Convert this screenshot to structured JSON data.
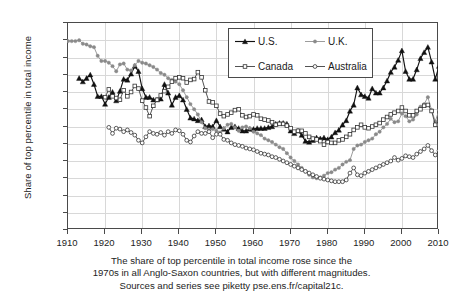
{
  "chart_data": {
    "type": "line",
    "title": "",
    "xlabel": "",
    "ylabel": "Share of top percentile in total income",
    "xlim": [
      1910,
      2010
    ],
    "ylim": [
      0,
      24
    ],
    "grid": true,
    "legend_position": "top-center",
    "ytick_labels": [
      "0%",
      "2%",
      "4%",
      "6%",
      "8%",
      "10%",
      "12%",
      "14%",
      "16%",
      "18%",
      "20%",
      "22%",
      "24%"
    ],
    "ytick_values": [
      0,
      2,
      4,
      6,
      8,
      10,
      12,
      14,
      16,
      18,
      20,
      22,
      24
    ],
    "xtick_labels": [
      "1910",
      "1920",
      "1930",
      "1940",
      "1950",
      "1960",
      "1970",
      "1980",
      "1990",
      "2000",
      "2010"
    ],
    "xtick_values": [
      1910,
      1920,
      1930,
      1940,
      1950,
      1960,
      1970,
      1980,
      1990,
      2000,
      2010
    ],
    "series": [
      {
        "name": "U.S.",
        "marker": "filled-triangle",
        "color": "#111111",
        "x": [
          1913,
          1914,
          1915,
          1916,
          1917,
          1918,
          1919,
          1920,
          1921,
          1922,
          1923,
          1924,
          1925,
          1926,
          1927,
          1928,
          1929,
          1930,
          1931,
          1932,
          1933,
          1934,
          1935,
          1936,
          1937,
          1938,
          1939,
          1940,
          1941,
          1942,
          1943,
          1944,
          1945,
          1946,
          1947,
          1948,
          1949,
          1950,
          1951,
          1952,
          1953,
          1954,
          1955,
          1956,
          1957,
          1958,
          1959,
          1960,
          1961,
          1962,
          1963,
          1964,
          1965,
          1966,
          1967,
          1968,
          1969,
          1970,
          1971,
          1972,
          1973,
          1974,
          1975,
          1976,
          1977,
          1978,
          1979,
          1980,
          1981,
          1982,
          1983,
          1984,
          1985,
          1986,
          1987,
          1988,
          1989,
          1990,
          1991,
          1992,
          1993,
          1994,
          1995,
          1996,
          1997,
          1998,
          1999,
          2000,
          2001,
          2002,
          2003,
          2004,
          2005,
          2006,
          2007,
          2008,
          2009,
          2010
        ],
        "y": [
          17.6,
          17.2,
          17.6,
          18.0,
          16.9,
          15.5,
          15.5,
          14.6,
          15.4,
          16.0,
          15.0,
          16.1,
          17.5,
          17.4,
          18.1,
          19.0,
          18.4,
          16.4,
          15.4,
          15.4,
          15.1,
          15.1,
          15.2,
          16.9,
          15.9,
          14.5,
          15.4,
          15.6,
          15.1,
          14.0,
          13.0,
          12.9,
          12.7,
          12.8,
          12.0,
          12.1,
          12.0,
          12.7,
          12.0,
          11.7,
          11.4,
          11.9,
          12.0,
          11.8,
          11.5,
          11.5,
          11.7,
          11.7,
          11.8,
          11.8,
          11.8,
          11.9,
          12.0,
          12.3,
          12.4,
          12.4,
          12.3,
          11.5,
          11.2,
          11.5,
          11.0,
          10.3,
          10.2,
          10.4,
          10.7,
          10.6,
          10.7,
          10.5,
          10.8,
          11.3,
          11.6,
          12.2,
          12.7,
          13.8,
          14.5,
          16.5,
          15.7,
          15.5,
          15.3,
          16.4,
          15.9,
          15.9,
          16.5,
          17.3,
          18.3,
          18.9,
          19.7,
          20.8,
          18.4,
          17.5,
          17.5,
          18.6,
          19.9,
          20.6,
          21.2,
          19.5,
          17.5,
          19.0
        ]
      },
      {
        "name": "U.K.",
        "marker": "filled-circle",
        "color": "#8a8a8a",
        "x": [
          1910,
          1911,
          1912,
          1913,
          1914,
          1915,
          1916,
          1917,
          1918,
          1919,
          1920,
          1921,
          1922,
          1923,
          1924,
          1925,
          1926,
          1927,
          1928,
          1929,
          1930,
          1931,
          1932,
          1933,
          1934,
          1935,
          1936,
          1937,
          1938,
          1939,
          1940,
          1941,
          1942,
          1943,
          1944,
          1945,
          1946,
          1947,
          1948,
          1949,
          1950,
          1951,
          1952,
          1953,
          1954,
          1955,
          1956,
          1957,
          1958,
          1959,
          1960,
          1961,
          1962,
          1963,
          1964,
          1965,
          1966,
          1967,
          1968,
          1969,
          1970,
          1971,
          1972,
          1973,
          1974,
          1975,
          1976,
          1977,
          1978,
          1979,
          1980,
          1981,
          1982,
          1983,
          1984,
          1985,
          1986,
          1987,
          1988,
          1989,
          1990,
          1991,
          1992,
          1993,
          1994,
          1995,
          1996,
          1997,
          1998,
          1999,
          2000,
          2001,
          2002,
          2003,
          2004,
          2005,
          2006,
          2007,
          2008,
          2009,
          2010
        ],
        "y": [
          21.9,
          21.9,
          21.9,
          22.0,
          21.6,
          21.5,
          21.3,
          21.2,
          20.2,
          19.6,
          19.6,
          19.4,
          19.0,
          18.4,
          19.2,
          19.3,
          18.6,
          18.5,
          19.1,
          19.6,
          19.4,
          19.3,
          19.1,
          18.9,
          18.6,
          18.2,
          18.0,
          17.6,
          17.4,
          17.2,
          16.9,
          16.2,
          15.4,
          14.6,
          14.0,
          13.4,
          12.5,
          11.8,
          11.6,
          11.7,
          11.5,
          11.3,
          11.8,
          12.2,
          12.3,
          11.9,
          11.5,
          11.9,
          12.0,
          11.8,
          11.4,
          11.2,
          11.0,
          10.6,
          10.4,
          10.2,
          9.9,
          9.6,
          9.4,
          8.9,
          8.4,
          8.0,
          7.6,
          7.2,
          6.8,
          6.4,
          6.1,
          6.0,
          6.1,
          6.3,
          6.6,
          6.7,
          7.0,
          7.2,
          7.6,
          7.9,
          8.1,
          9.4,
          9.8,
          9.9,
          10.2,
          10.4,
          10.6,
          11.1,
          11.4,
          11.9,
          12.3,
          12.9,
          12.5,
          12.6,
          13.5,
          13.2,
          12.6,
          12.8,
          13.4,
          14.3,
          14.6,
          15.4,
          13.9,
          12.6,
          13.9
        ]
      },
      {
        "name": "Canada",
        "marker": "open-square",
        "color": "#333333",
        "x": [
          1920,
          1921,
          1922,
          1923,
          1924,
          1925,
          1926,
          1927,
          1928,
          1929,
          1930,
          1931,
          1932,
          1933,
          1934,
          1935,
          1936,
          1937,
          1938,
          1939,
          1940,
          1941,
          1942,
          1943,
          1944,
          1945,
          1946,
          1947,
          1948,
          1949,
          1950,
          1951,
          1952,
          1953,
          1954,
          1955,
          1956,
          1957,
          1958,
          1959,
          1960,
          1961,
          1962,
          1963,
          1964,
          1965,
          1966,
          1967,
          1968,
          1969,
          1970,
          1971,
          1972,
          1973,
          1974,
          1975,
          1976,
          1977,
          1978,
          1979,
          1980,
          1981,
          1982,
          1983,
          1984,
          1985,
          1986,
          1987,
          1988,
          1989,
          1990,
          1991,
          1992,
          1993,
          1994,
          1995,
          1996,
          1997,
          1998,
          1999,
          2000,
          2001,
          2002,
          2003,
          2004,
          2005,
          2006,
          2007,
          2008,
          2009,
          2010
        ],
        "y": [
          15.4,
          16.3,
          15.5,
          15.3,
          15.1,
          16.2,
          15.5,
          16.0,
          16.7,
          16.4,
          15.0,
          14.2,
          13.2,
          14.4,
          15.1,
          15.6,
          16.1,
          16.6,
          17.2,
          17.6,
          17.7,
          17.6,
          17.1,
          17.4,
          17.5,
          18.3,
          17.7,
          16.2,
          14.9,
          14.8,
          14.4,
          13.5,
          13.2,
          13.4,
          13.6,
          13.9,
          14.0,
          13.3,
          13.1,
          13.2,
          13.4,
          13.3,
          12.9,
          12.8,
          12.7,
          12.5,
          12.2,
          12.3,
          12.3,
          12.1,
          11.8,
          11.4,
          11.5,
          11.5,
          11.2,
          10.8,
          10.6,
          10.5,
          10.3,
          9.9,
          10.2,
          10.1,
          10.1,
          10.4,
          10.5,
          10.8,
          11.1,
          11.6,
          11.9,
          12.2,
          11.9,
          11.8,
          12.0,
          12.2,
          12.4,
          12.8,
          13.1,
          13.4,
          13.6,
          13.8,
          14.2,
          13.8,
          13.3,
          13.3,
          13.8,
          14.0,
          14.4,
          14.5,
          13.8,
          12.2,
          12.2
        ]
      },
      {
        "name": "Australia",
        "marker": "open-circle",
        "color": "#333333",
        "x": [
          1921,
          1922,
          1923,
          1924,
          1925,
          1926,
          1927,
          1928,
          1929,
          1930,
          1931,
          1932,
          1933,
          1934,
          1935,
          1936,
          1937,
          1938,
          1939,
          1940,
          1941,
          1942,
          1943,
          1944,
          1945,
          1946,
          1947,
          1948,
          1949,
          1950,
          1951,
          1952,
          1953,
          1954,
          1955,
          1956,
          1957,
          1958,
          1959,
          1960,
          1961,
          1962,
          1963,
          1964,
          1965,
          1966,
          1967,
          1968,
          1969,
          1970,
          1971,
          1972,
          1973,
          1974,
          1975,
          1976,
          1977,
          1978,
          1979,
          1980,
          1981,
          1982,
          1983,
          1984,
          1985,
          1986,
          1987,
          1988,
          1989,
          1990,
          1991,
          1992,
          1993,
          1994,
          1995,
          1996,
          1997,
          1998,
          1999,
          2000,
          2001,
          2002,
          2003,
          2004,
          2005,
          2006,
          2007,
          2008,
          2009,
          2010
        ],
        "y": [
          11.9,
          11.2,
          11.8,
          11.7,
          11.4,
          11.6,
          11.3,
          11.0,
          10.4,
          10.1,
          10.8,
          11.4,
          11.2,
          11.1,
          11.3,
          11.0,
          11.4,
          11.2,
          11.6,
          11.5,
          11.1,
          10.4,
          10.2,
          10.9,
          11.4,
          11.2,
          11.2,
          11.4,
          10.7,
          11.1,
          11.1,
          10.5,
          10.4,
          10.1,
          9.9,
          9.8,
          9.7,
          9.5,
          9.4,
          9.3,
          9.1,
          8.9,
          8.8,
          8.7,
          8.5,
          8.4,
          8.2,
          8.0,
          7.8,
          7.6,
          7.4,
          7.2,
          7.0,
          6.8,
          6.6,
          6.4,
          6.2,
          6.0,
          5.9,
          5.8,
          5.7,
          5.6,
          5.6,
          5.6,
          5.8,
          6.6,
          7.2,
          6.4,
          6.3,
          6.6,
          6.8,
          7.0,
          7.2,
          7.4,
          7.6,
          7.8,
          8.0,
          8.4,
          8.1,
          8.3,
          8.6,
          8.5,
          8.4,
          8.8,
          9.1,
          9.4,
          9.8,
          9.2,
          8.7,
          9.2
        ]
      }
    ],
    "caption_lines": [
      "The share of top percentile in total income rose since the",
      "1970s in all Anglo-Saxon countries, but with different magnitudes.",
      "Sources and series see piketty pse.ens.fr/capital21c."
    ]
  },
  "colors": {
    "us": "#111111",
    "uk": "#8a8a8a",
    "canada": "#333333",
    "australia": "#333333",
    "grid": "#d8d8d8",
    "axis": "#4a4a4a"
  }
}
